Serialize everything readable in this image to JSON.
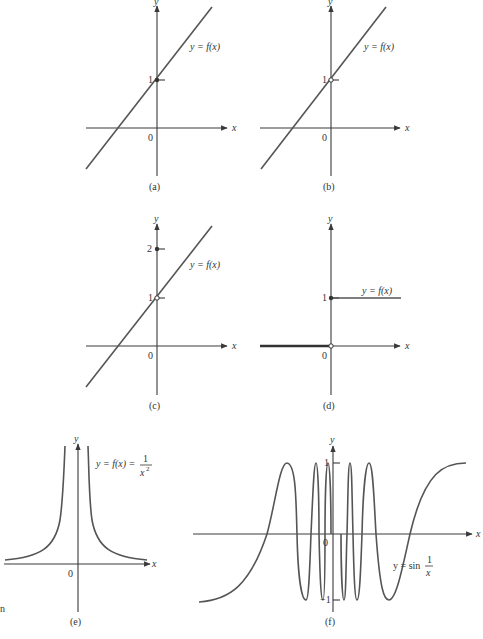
{
  "figure": {
    "panels": [
      {
        "id": "a",
        "caption": "(a)",
        "function_label": "y = f(x)",
        "y_tick": "1",
        "origin": "0",
        "x_axis": "x",
        "y_axis": "y",
        "marker_at_1": "filled"
      },
      {
        "id": "b",
        "caption": "(b)",
        "function_label": "y = f(x)",
        "y_tick": "1",
        "origin": "0",
        "x_axis": "x",
        "y_axis": "y",
        "marker_at_1": "open"
      },
      {
        "id": "c",
        "caption": "(c)",
        "function_label": "y = f(x)",
        "y_tick": "1",
        "y_tick_2": "2",
        "origin": "0",
        "x_axis": "x",
        "y_axis": "y",
        "marker_at_1": "open",
        "marker_at_2": "filled"
      },
      {
        "id": "d",
        "caption": "(d)",
        "function_label": "y = f(x)",
        "y_tick": "1",
        "origin": "0",
        "x_axis": "x",
        "y_axis": "y",
        "marker_at_1": "filled",
        "marker_at_0": "open"
      },
      {
        "id": "e",
        "caption": "(e)",
        "function_label_prefix": "y = f(x) =",
        "fraction_num": "1",
        "fraction_den": "x",
        "fraction_exp": "2",
        "origin": "0",
        "x_axis": "x",
        "y_axis": "y"
      },
      {
        "id": "f",
        "caption": "(f)",
        "function_label_prefix": "y = sin",
        "fraction_num": "1",
        "fraction_den": "x",
        "y_tick_pos": "1",
        "y_tick_neg": "−1",
        "origin": "0",
        "x_axis": "x",
        "y_axis": "y"
      }
    ],
    "margin_fragment": "n"
  },
  "colors": {
    "axis": "#3a3a3a",
    "curve": "#555555",
    "background": "#ffffff"
  }
}
